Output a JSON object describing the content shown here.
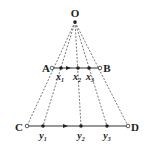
{
  "diagram": {
    "apex": {
      "label": "O",
      "x": 75,
      "y": 22
    },
    "segment_top": {
      "start": {
        "label": "A",
        "x": 52,
        "y": 68
      },
      "end": {
        "label": "B",
        "x": 100,
        "y": 68
      },
      "points": [
        {
          "label": "x",
          "sub": "1",
          "x": 61
        },
        {
          "label": "x",
          "sub": "2",
          "x": 78
        },
        {
          "label": "x",
          "sub": "3",
          "x": 89
        }
      ],
      "arrow_x": 69
    },
    "segment_bottom": {
      "start": {
        "label": "C",
        "x": 27,
        "y": 126
      },
      "end": {
        "label": "D",
        "x": 128,
        "y": 126
      },
      "points": [
        {
          "label": "y",
          "sub": "1",
          "x": 43
        },
        {
          "label": "y",
          "sub": "2",
          "x": 81
        },
        {
          "label": "y",
          "sub": "3",
          "x": 107
        }
      ],
      "arrow_x": 66
    },
    "colors": {
      "line": "#333333",
      "dashed": "#555555",
      "text": "#222222"
    }
  }
}
